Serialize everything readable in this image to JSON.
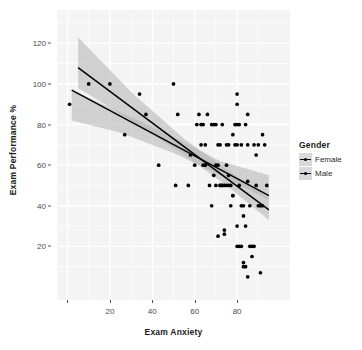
{
  "chart_data": {
    "type": "scatter",
    "title": "",
    "xlabel": "Exam Anxiety",
    "ylabel": "Exam Performance %",
    "xlim": [
      0,
      100
    ],
    "ylim": [
      0,
      130
    ],
    "grid": true,
    "legend": {
      "title": "Gender",
      "position": "right",
      "entries": [
        {
          "name": "Female",
          "color": "#000000",
          "key": "line-point-key"
        },
        {
          "name": "Male",
          "color": "#000000",
          "key": "line-point-key"
        }
      ]
    },
    "xticks": [
      {
        "value": 0,
        "label": ""
      },
      {
        "value": 20,
        "label": "20"
      },
      {
        "value": 40,
        "label": "40"
      },
      {
        "value": 60,
        "label": "60"
      },
      {
        "value": 80,
        "label": "80"
      }
    ],
    "yticks": [
      {
        "value": 20,
        "label": "20"
      },
      {
        "value": 40,
        "label": "40"
      },
      {
        "value": 60,
        "label": "60"
      },
      {
        "value": 80,
        "label": "80"
      },
      {
        "value": 100,
        "label": "100"
      },
      {
        "value": 120,
        "label": "120"
      }
    ],
    "series": [
      {
        "name": "Female",
        "type": "scatter+fit",
        "marker": "circle",
        "color": "#000000",
        "fit": {
          "x0": 5,
          "y0": 108,
          "x1": 95,
          "y1": 38,
          "ribbon_color": "#b3b3b3"
        },
        "ribbon": [
          {
            "x": 5,
            "lo": 98,
            "hi": 123
          },
          {
            "x": 30,
            "lo": 82,
            "hi": 96
          },
          {
            "x": 55,
            "lo": 65,
            "hi": 73
          },
          {
            "x": 75,
            "lo": 50,
            "hi": 58
          },
          {
            "x": 95,
            "lo": 33,
            "hi": 44
          }
        ],
        "points": [
          [
            10,
            100
          ],
          [
            20,
            100
          ],
          [
            34,
            95
          ],
          [
            37,
            85
          ],
          [
            50,
            100
          ],
          [
            52,
            85
          ],
          [
            58,
            65
          ],
          [
            61,
            80
          ],
          [
            62,
            85
          ],
          [
            63,
            80
          ],
          [
            64,
            80
          ],
          [
            64,
            60
          ],
          [
            65,
            70
          ],
          [
            66,
            85
          ],
          [
            68,
            80
          ],
          [
            69,
            80
          ],
          [
            70,
            80
          ],
          [
            70,
            50
          ],
          [
            71,
            70
          ],
          [
            72,
            70
          ],
          [
            72,
            50
          ],
          [
            73,
            50
          ],
          [
            73,
            80
          ],
          [
            74,
            26
          ],
          [
            74,
            28
          ],
          [
            75,
            60
          ],
          [
            75,
            50
          ],
          [
            76,
            55
          ],
          [
            76,
            50
          ],
          [
            77,
            50
          ],
          [
            78,
            75
          ],
          [
            78,
            45
          ],
          [
            79,
            80
          ],
          [
            80,
            80
          ],
          [
            80,
            95
          ],
          [
            80,
            90
          ],
          [
            80,
            20
          ],
          [
            81,
            80
          ],
          [
            82,
            70
          ],
          [
            82,
            40
          ],
          [
            83,
            10
          ],
          [
            83,
            12
          ],
          [
            84,
            80
          ],
          [
            84,
            30
          ],
          [
            85,
            85
          ],
          [
            85,
            70
          ],
          [
            86,
            20
          ],
          [
            87,
            15
          ],
          [
            88,
            70
          ],
          [
            89,
            50
          ],
          [
            90,
            40
          ],
          [
            91,
            40
          ],
          [
            92,
            75
          ],
          [
            94,
            50
          ]
        ]
      },
      {
        "name": "Male",
        "type": "scatter+fit",
        "marker": "circle",
        "color": "#000000",
        "fit": {
          "x0": 2,
          "y0": 97,
          "x1": 95,
          "y1": 45,
          "ribbon_color": "#b3b3b3"
        },
        "ribbon": [
          {
            "x": 2,
            "lo": 82,
            "hi": 97
          },
          {
            "x": 25,
            "lo": 76,
            "hi": 86
          },
          {
            "x": 50,
            "lo": 66,
            "hi": 74
          },
          {
            "x": 72,
            "lo": 55,
            "hi": 62
          },
          {
            "x": 95,
            "lo": 43,
            "hi": 55
          }
        ],
        "points": [
          [
            1,
            90
          ],
          [
            27,
            75
          ],
          [
            43,
            60
          ],
          [
            51,
            50
          ],
          [
            57,
            50
          ],
          [
            60,
            60
          ],
          [
            63,
            70
          ],
          [
            65,
            60
          ],
          [
            67,
            50
          ],
          [
            68,
            40
          ],
          [
            69,
            55
          ],
          [
            70,
            60
          ],
          [
            71,
            60
          ],
          [
            71,
            25
          ],
          [
            72,
            50
          ],
          [
            73,
            50
          ],
          [
            74,
            50
          ],
          [
            75,
            70
          ],
          [
            76,
            70
          ],
          [
            77,
            40
          ],
          [
            78,
            45
          ],
          [
            79,
            70
          ],
          [
            80,
            70
          ],
          [
            80,
            30
          ],
          [
            81,
            50
          ],
          [
            81,
            20
          ],
          [
            82,
            20
          ],
          [
            83,
            40
          ],
          [
            83,
            35
          ],
          [
            84,
            10
          ],
          [
            85,
            52
          ],
          [
            85,
            5
          ],
          [
            86,
            40
          ],
          [
            87,
            20
          ],
          [
            88,
            20
          ],
          [
            89,
            65
          ],
          [
            90,
            70
          ],
          [
            91,
            7
          ],
          [
            92,
            40
          ],
          [
            93,
            70
          ]
        ]
      }
    ]
  },
  "panel": {
    "background": "#f4f4f4",
    "gridline_color": "#ffffff",
    "ribbon_color": "#b8b8b8",
    "line_color": "#000000",
    "point_color": "#111111"
  }
}
